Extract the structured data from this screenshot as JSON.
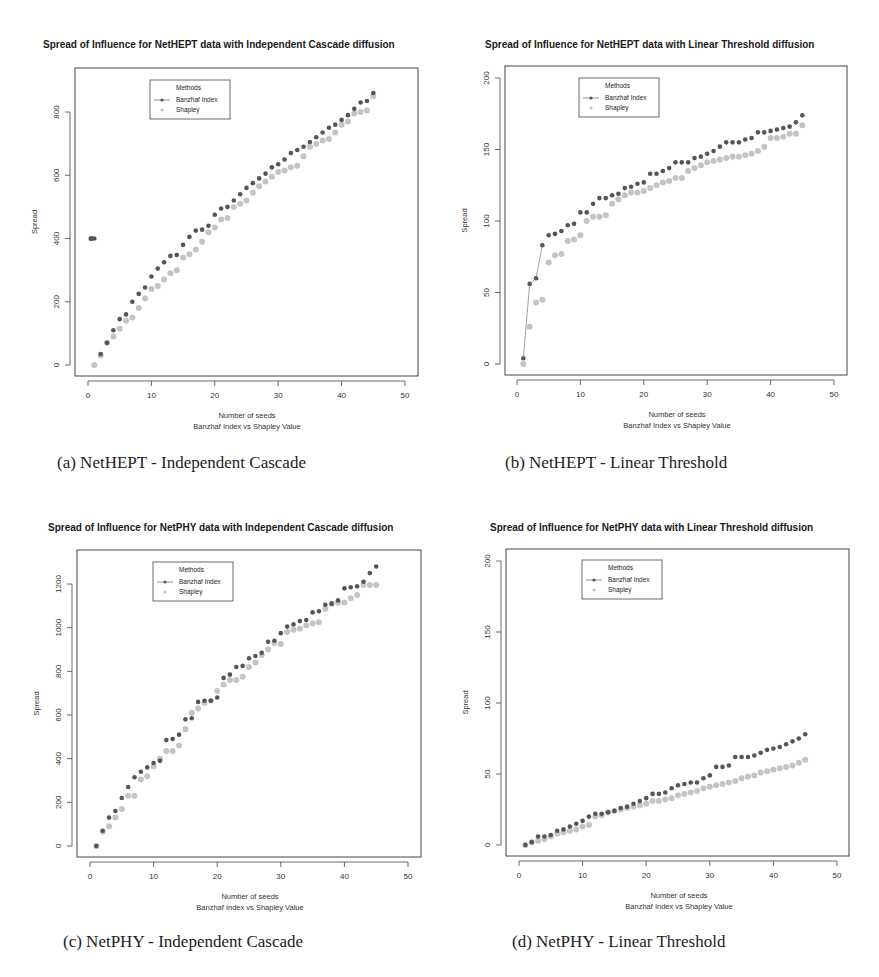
{
  "chart_data": [
    {
      "id": "a",
      "type": "scatter",
      "title": "Spread of Influence for NetHEPT data with Independent Cascade diffusion",
      "xlabel": "Number of seeds",
      "xlabel2": "Banzhaf Index vs Shapley Value",
      "ylabel": "Spread",
      "caption": "(a) NetHEPT - Independent Cascade",
      "xlim": [
        0,
        50
      ],
      "ylim": [
        0,
        800
      ],
      "xticks": [
        0,
        10,
        20,
        30,
        40,
        50
      ],
      "yticks": [
        0,
        200,
        400,
        600,
        800
      ],
      "grid": false,
      "legend": {
        "title": "Methods",
        "position": "top-left",
        "entries": [
          "Banzhaf Index",
          "Shapley"
        ]
      },
      "x": [
        1,
        2,
        3,
        4,
        5,
        6,
        7,
        8,
        9,
        10,
        11,
        12,
        13,
        14,
        15,
        16,
        17,
        18,
        19,
        20,
        21,
        22,
        23,
        24,
        25,
        26,
        27,
        28,
        29,
        30,
        31,
        32,
        33,
        34,
        35,
        36,
        37,
        38,
        39,
        40,
        41,
        42,
        43,
        44,
        45
      ],
      "series": [
        {
          "name": "Banzhaf Index",
          "color": "#555555",
          "values": [
            400,
            35,
            70,
            110,
            145,
            160,
            200,
            225,
            245,
            280,
            305,
            325,
            345,
            348,
            380,
            405,
            425,
            428,
            440,
            475,
            495,
            500,
            520,
            540,
            560,
            575,
            590,
            605,
            625,
            635,
            650,
            670,
            680,
            690,
            705,
            720,
            735,
            750,
            760,
            775,
            790,
            810,
            830,
            835,
            860
          ],
          "outlier": {
            "x": 0.5,
            "y": 400
          }
        },
        {
          "name": "Shapley",
          "color": "#c4c4c4",
          "values": [
            0,
            30,
            70,
            90,
            115,
            140,
            150,
            180,
            210,
            240,
            250,
            270,
            290,
            300,
            340,
            350,
            365,
            390,
            420,
            435,
            460,
            465,
            500,
            510,
            520,
            545,
            565,
            580,
            595,
            610,
            615,
            625,
            630,
            660,
            690,
            700,
            710,
            715,
            735,
            760,
            770,
            795,
            800,
            805,
            850
          ]
        }
      ]
    },
    {
      "id": "b",
      "type": "scatter",
      "title": "Spread of Influence for NetHEPT data with Linear Threshold diffusion",
      "xlabel": "Number of seeds",
      "xlabel2": "Banzhaf Index vs Shapley Value",
      "ylabel": "Spread",
      "caption": "(b) NetHEPT - Linear Threshold",
      "xlim": [
        0,
        50
      ],
      "ylim": [
        0,
        200
      ],
      "xticks": [
        0,
        10,
        20,
        30,
        40,
        50
      ],
      "yticks": [
        0,
        50,
        100,
        150,
        200
      ],
      "grid": false,
      "legend": {
        "title": "Methods",
        "position": "top-left",
        "entries": [
          "Banzhaf Index",
          "Shapley"
        ]
      },
      "x": [
        1,
        2,
        3,
        4,
        5,
        6,
        7,
        8,
        9,
        10,
        11,
        12,
        13,
        14,
        15,
        16,
        17,
        18,
        19,
        20,
        21,
        22,
        23,
        24,
        25,
        26,
        27,
        28,
        29,
        30,
        31,
        32,
        33,
        34,
        35,
        36,
        37,
        38,
        39,
        40,
        41,
        42,
        43,
        44,
        45
      ],
      "series": [
        {
          "name": "Banzhaf Index",
          "color": "#555555",
          "values": [
            4,
            56,
            60,
            83,
            90,
            91,
            93,
            97,
            98,
            106,
            106,
            112,
            116,
            116,
            118,
            119,
            123,
            124,
            126,
            127,
            133,
            133,
            135,
            137,
            141,
            141,
            141,
            144,
            145,
            147,
            149,
            152,
            155,
            155,
            155,
            157,
            158,
            162,
            162,
            163,
            164,
            165,
            166,
            169,
            174
          ]
        },
        {
          "name": "Shapley",
          "color": "#c4c4c4",
          "values": [
            0,
            26,
            43,
            45,
            71,
            76,
            77,
            86,
            87,
            90,
            100,
            103,
            103,
            104,
            112,
            115,
            118,
            120,
            120,
            121,
            123,
            125,
            127,
            128,
            130,
            130,
            135,
            137,
            139,
            141,
            142,
            143,
            144,
            145,
            145,
            146,
            147,
            149,
            152,
            158,
            158,
            159,
            161,
            161,
            167
          ]
        }
      ]
    },
    {
      "id": "c",
      "type": "scatter",
      "title": "Spread of Influence for NetPHY data with Independent Cascade diffusion",
      "xlabel": "Number of seeds",
      "xlabel2": "Banzhaf Index vs Shapley Value",
      "ylabel": "Spread",
      "caption": "(c) NetPHY - Independent Cascade",
      "xlim": [
        0,
        50
      ],
      "ylim": [
        0,
        1200
      ],
      "xticks": [
        0,
        10,
        20,
        30,
        40,
        50
      ],
      "yticks": [
        0,
        200,
        400,
        600,
        800,
        1000,
        1200
      ],
      "grid": false,
      "legend": {
        "title": "Methods",
        "position": "top-left",
        "entries": [
          "Banzhaf Index",
          "Shapley"
        ]
      },
      "x": [
        1,
        2,
        3,
        4,
        5,
        6,
        7,
        8,
        9,
        10,
        11,
        12,
        13,
        14,
        15,
        16,
        17,
        18,
        19,
        20,
        21,
        22,
        23,
        24,
        25,
        26,
        27,
        28,
        29,
        30,
        31,
        32,
        33,
        34,
        35,
        36,
        37,
        38,
        39,
        40,
        41,
        42,
        43,
        44,
        45
      ],
      "series": [
        {
          "name": "Banzhaf Index",
          "color": "#555555",
          "values": [
            0,
            70,
            130,
            160,
            220,
            270,
            315,
            340,
            360,
            380,
            390,
            485,
            490,
            510,
            580,
            585,
            660,
            665,
            665,
            680,
            770,
            785,
            820,
            825,
            860,
            870,
            885,
            935,
            940,
            975,
            1005,
            1015,
            1030,
            1035,
            1070,
            1075,
            1105,
            1110,
            1125,
            1180,
            1185,
            1190,
            1210,
            1250,
            1280
          ]
        },
        {
          "name": "Shapley",
          "color": "#c4c4c4",
          "values": [
            0,
            65,
            90,
            130,
            170,
            230,
            230,
            305,
            320,
            365,
            400,
            435,
            435,
            460,
            535,
            610,
            630,
            655,
            665,
            710,
            740,
            760,
            760,
            775,
            820,
            840,
            875,
            900,
            930,
            925,
            980,
            990,
            995,
            1010,
            1020,
            1025,
            1085,
            1110,
            1115,
            1115,
            1135,
            1150,
            1195,
            1195,
            1195
          ]
        }
      ]
    },
    {
      "id": "d",
      "type": "scatter",
      "title": "Spread of Influence for NetPHY data with Linear Threshold diffusion",
      "xlabel": "Number of seeds",
      "xlabel2": "Banzhaf Index vs Shapley Value",
      "ylabel": "Spread",
      "caption": "(d) NetPHY - Linear Threshold",
      "xlim": [
        0,
        50
      ],
      "ylim": [
        0,
        200
      ],
      "xticks": [
        0,
        10,
        20,
        30,
        40,
        50
      ],
      "yticks": [
        0,
        50,
        100,
        150,
        200
      ],
      "grid": false,
      "legend": {
        "title": "Methods",
        "position": "top-left",
        "entries": [
          "Banzhaf Index",
          "Shapley"
        ]
      },
      "x": [
        1,
        2,
        3,
        4,
        5,
        6,
        7,
        8,
        9,
        10,
        11,
        12,
        13,
        14,
        15,
        16,
        17,
        18,
        19,
        20,
        21,
        22,
        23,
        24,
        25,
        26,
        27,
        28,
        29,
        30,
        31,
        32,
        33,
        34,
        35,
        36,
        37,
        38,
        39,
        40,
        41,
        42,
        43,
        44,
        45
      ],
      "series": [
        {
          "name": "Banzhaf Index",
          "color": "#555555",
          "values": [
            0,
            2,
            6,
            6,
            7,
            10,
            11,
            13,
            15,
            17,
            20,
            22,
            22,
            23,
            24,
            26,
            27,
            29,
            31,
            33,
            36,
            36,
            37,
            40,
            42,
            43,
            44,
            44,
            47,
            49,
            55,
            55,
            56,
            62,
            62,
            62,
            63,
            65,
            67,
            68,
            69,
            71,
            73,
            75,
            78
          ]
        },
        {
          "name": "Shapley",
          "color": "#c4c4c4",
          "values": [
            0,
            2,
            3,
            4,
            6,
            8,
            9,
            10,
            11,
            13,
            14,
            20,
            21,
            23,
            24,
            25,
            26,
            27,
            28,
            29,
            31,
            31,
            32,
            33,
            35,
            36,
            37,
            38,
            40,
            41,
            42,
            43,
            44,
            45,
            47,
            48,
            49,
            51,
            52,
            53,
            54,
            55,
            56,
            58,
            60
          ]
        }
      ]
    }
  ]
}
